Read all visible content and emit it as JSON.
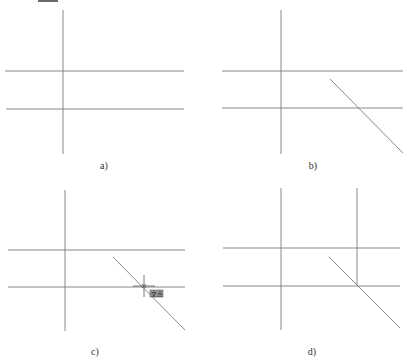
{
  "figure": {
    "top_mark": {
      "x": 38,
      "y": 0,
      "w": 20,
      "h": 2
    },
    "line_color": "#7a7a7a",
    "snap_color": "#555555",
    "panels": [
      {
        "id": "a",
        "caption": "a)",
        "caption_pos": {
          "x": 104,
          "y": 160
        },
        "lines": [
          {
            "x1": 63,
            "y1": 10,
            "x2": 63,
            "y2": 154
          },
          {
            "x1": 5,
            "y1": 71,
            "x2": 184,
            "y2": 71
          },
          {
            "x1": 6,
            "y1": 109,
            "x2": 184,
            "y2": 109
          }
        ]
      },
      {
        "id": "b",
        "caption": "b)",
        "caption_pos": {
          "x": 313,
          "y": 160
        },
        "lines": [
          {
            "x1": 281,
            "y1": 10,
            "x2": 281,
            "y2": 154
          },
          {
            "x1": 222,
            "y1": 71,
            "x2": 403,
            "y2": 71
          },
          {
            "x1": 222,
            "y1": 108,
            "x2": 403,
            "y2": 108
          },
          {
            "x1": 330,
            "y1": 79,
            "x2": 403,
            "y2": 153
          }
        ]
      },
      {
        "id": "c",
        "caption": "c)",
        "caption_pos": {
          "x": 95,
          "y": 346
        },
        "lines": [
          {
            "x1": 65,
            "y1": 190,
            "x2": 65,
            "y2": 331
          },
          {
            "x1": 8,
            "y1": 250,
            "x2": 185,
            "y2": 250
          },
          {
            "x1": 8,
            "y1": 287,
            "x2": 185,
            "y2": 287
          },
          {
            "x1": 113,
            "y1": 257,
            "x2": 185,
            "y2": 330
          }
        ],
        "snap": {
          "crosshair": {
            "x": 144,
            "y": 286,
            "arm": 11
          },
          "marker_size": 4,
          "tooltip": {
            "x": 150,
            "y": 290,
            "w": 13,
            "h": 7,
            "label": "交点"
          }
        }
      },
      {
        "id": "d",
        "caption": "d)",
        "caption_pos": {
          "x": 312,
          "y": 346
        },
        "lines": [
          {
            "x1": 281,
            "y1": 188,
            "x2": 281,
            "y2": 330
          },
          {
            "x1": 357,
            "y1": 188,
            "x2": 357,
            "y2": 285
          },
          {
            "x1": 223,
            "y1": 248,
            "x2": 400,
            "y2": 248
          },
          {
            "x1": 223,
            "y1": 286,
            "x2": 400,
            "y2": 286
          },
          {
            "x1": 329,
            "y1": 257,
            "x2": 400,
            "y2": 328
          }
        ]
      }
    ]
  }
}
